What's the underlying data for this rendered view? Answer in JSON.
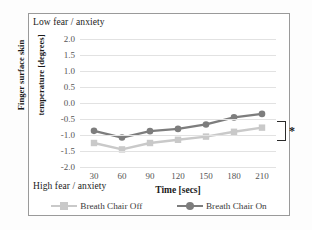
{
  "figure": {
    "annotations": {
      "top_left": "Low fear / anxiety",
      "bottom_left": "High fear / anxiety",
      "significance_marker": "*"
    }
  },
  "legend": {
    "position": "bottom",
    "items": [
      {
        "label": "Breath Chair Off",
        "color": "#c9c9c9",
        "marker": "square"
      },
      {
        "label": "Breath Chair On",
        "color": "#7d7d7d",
        "marker": "circle"
      }
    ]
  },
  "chart_data": {
    "type": "line",
    "title": "",
    "xlabel": "Time [secs]",
    "ylabel": "Finger surface skin temperature [degrees]",
    "ylabel_line1": "Finger surface skin",
    "ylabel_line2": "temperature [degrees]",
    "x": [
      30,
      60,
      90,
      120,
      150,
      180,
      210
    ],
    "xtick_labels": [
      "30",
      "60",
      "90",
      "120",
      "150",
      "180",
      "210"
    ],
    "ytick_labels": [
      "2.0",
      "1.5",
      "1.0",
      "0.5",
      "0.0",
      "-0.5",
      "-1.0",
      "-1.5",
      "-2.0"
    ],
    "yticks": [
      2.0,
      1.5,
      1.0,
      0.5,
      0.0,
      -0.5,
      -1.0,
      -1.5,
      -2.0
    ],
    "ylim": [
      -2.0,
      2.0
    ],
    "xlim": [
      30,
      210
    ],
    "grid": true,
    "series": [
      {
        "name": "Breath Chair Off",
        "color": "#c9c9c9",
        "marker": "square",
        "values": [
          -1.25,
          -1.45,
          -1.25,
          -1.15,
          -1.05,
          -0.9,
          -0.77
        ]
      },
      {
        "name": "Breath Chair On",
        "color": "#7d7d7d",
        "marker": "circle",
        "values": [
          -0.87,
          -1.08,
          -0.88,
          -0.81,
          -0.67,
          -0.45,
          -0.34
        ]
      }
    ],
    "annotations": [
      {
        "text": "Low fear / anxiety",
        "position": "top-left"
      },
      {
        "text": "High fear / anxiety",
        "position": "bottom-left"
      },
      {
        "text": "*",
        "position": "right-bracket",
        "compares": [
          "Breath Chair Off",
          "Breath Chair On"
        ]
      }
    ]
  }
}
